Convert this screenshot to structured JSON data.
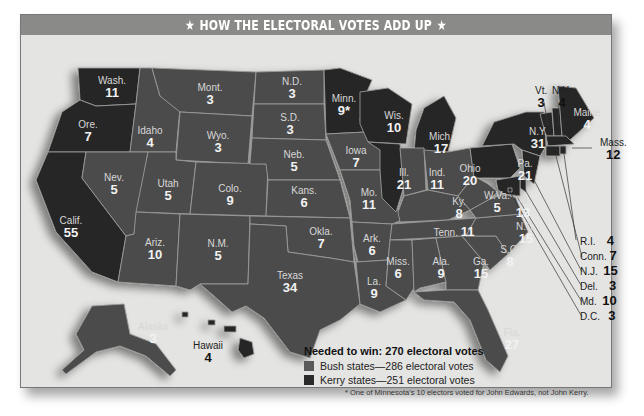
{
  "title": "HOW THE ELECTORAL VOTES ADD UP",
  "title_decoration": "star-icon",
  "legend": {
    "needed": "Needed to win: 270 electoral votes",
    "items": [
      {
        "label": "Bush states—286 electoral votes",
        "color": "#4b4b4b"
      },
      {
        "label": "Kerry states—251 electoral votes",
        "color": "#262626"
      }
    ]
  },
  "footnote": "* One of Minnesota's 10 electors voted for John Edwards, not John Kerry.",
  "colors": {
    "bush": "#4b4b4b",
    "kerry": "#262626",
    "background": "#e4e4e2",
    "title_bar": "#8a8a88"
  },
  "states": {
    "wash": {
      "name": "Wash.",
      "votes": "11",
      "winner": "Kerry"
    },
    "ore": {
      "name": "Ore.",
      "votes": "7",
      "winner": "Kerry"
    },
    "calif": {
      "name": "Calif.",
      "votes": "55",
      "winner": "Kerry"
    },
    "idaho": {
      "name": "Idaho",
      "votes": "4",
      "winner": "Bush"
    },
    "nev": {
      "name": "Nev.",
      "votes": "5",
      "winner": "Bush"
    },
    "mont": {
      "name": "Mont.",
      "votes": "3",
      "winner": "Bush"
    },
    "wyo": {
      "name": "Wyo.",
      "votes": "3",
      "winner": "Bush"
    },
    "utah": {
      "name": "Utah",
      "votes": "5",
      "winner": "Bush"
    },
    "ariz": {
      "name": "Ariz.",
      "votes": "10",
      "winner": "Bush"
    },
    "colo": {
      "name": "Colo.",
      "votes": "9",
      "winner": "Bush"
    },
    "nm": {
      "name": "N.M.",
      "votes": "5",
      "winner": "Bush"
    },
    "nd": {
      "name": "N.D.",
      "votes": "3",
      "winner": "Bush"
    },
    "sd": {
      "name": "S.D.",
      "votes": "3",
      "winner": "Bush"
    },
    "neb": {
      "name": "Neb.",
      "votes": "5",
      "winner": "Bush"
    },
    "kans": {
      "name": "Kans.",
      "votes": "6",
      "winner": "Bush"
    },
    "okla": {
      "name": "Okla.",
      "votes": "7",
      "winner": "Bush"
    },
    "texas": {
      "name": "Texas",
      "votes": "34",
      "winner": "Bush"
    },
    "minn": {
      "name": "Minn.",
      "votes": "9*",
      "winner": "Kerry"
    },
    "iowa": {
      "name": "Iowa",
      "votes": "7",
      "winner": "Bush"
    },
    "mo": {
      "name": "Mo.",
      "votes": "11",
      "winner": "Bush"
    },
    "ark": {
      "name": "Ark.",
      "votes": "6",
      "winner": "Bush"
    },
    "la": {
      "name": "La.",
      "votes": "9",
      "winner": "Bush"
    },
    "wis": {
      "name": "Wis.",
      "votes": "10",
      "winner": "Kerry"
    },
    "ill": {
      "name": "Ill.",
      "votes": "21",
      "winner": "Kerry"
    },
    "mich": {
      "name": "Mich.",
      "votes": "17",
      "winner": "Kerry"
    },
    "ind": {
      "name": "Ind.",
      "votes": "11",
      "winner": "Bush"
    },
    "ohio": {
      "name": "Ohio",
      "votes": "20",
      "winner": "Bush"
    },
    "ky": {
      "name": "Ky.",
      "votes": "8",
      "winner": "Bush"
    },
    "tenn": {
      "name": "Tenn.",
      "votes": "11",
      "winner": "Bush"
    },
    "miss": {
      "name": "Miss.",
      "votes": "6",
      "winner": "Bush"
    },
    "ala": {
      "name": "Ala.",
      "votes": "9",
      "winner": "Bush"
    },
    "ga": {
      "name": "Ga.",
      "votes": "15",
      "winner": "Bush"
    },
    "fla": {
      "name": "Fla.",
      "votes": "27",
      "winner": "Bush"
    },
    "sc": {
      "name": "S.C.",
      "votes": "8",
      "winner": "Bush"
    },
    "nc": {
      "name": "N.C.",
      "votes": "15",
      "winner": "Bush"
    },
    "va": {
      "name": "Va.",
      "votes": "13",
      "winner": "Bush"
    },
    "wva": {
      "name": "W.Va.",
      "votes": "5",
      "winner": "Bush"
    },
    "pa": {
      "name": "Pa.",
      "votes": "21",
      "winner": "Kerry"
    },
    "ny": {
      "name": "N.Y.",
      "votes": "31",
      "winner": "Kerry"
    },
    "vt": {
      "name": "Vt.",
      "votes": "3",
      "winner": "Kerry"
    },
    "nh": {
      "name": "N.H.",
      "votes": "4",
      "winner": "Kerry"
    },
    "maine": {
      "name": "Maine",
      "votes": "4",
      "winner": "Kerry"
    },
    "mass": {
      "name": "Mass.",
      "votes": "12",
      "winner": "Kerry"
    },
    "ri": {
      "name": "R.I.",
      "votes": "4",
      "winner": "Kerry"
    },
    "conn": {
      "name": "Conn.",
      "votes": "7",
      "winner": "Kerry"
    },
    "nj": {
      "name": "N.J.",
      "votes": "15",
      "winner": "Kerry"
    },
    "del": {
      "name": "Del.",
      "votes": "3",
      "winner": "Kerry"
    },
    "md": {
      "name": "Md.",
      "votes": "10",
      "winner": "Kerry"
    },
    "dc": {
      "name": "D.C.",
      "votes": "3",
      "winner": "Kerry"
    },
    "alaska": {
      "name": "Alaska",
      "votes": "3",
      "winner": "Bush"
    },
    "hawaii": {
      "name": "Hawaii",
      "votes": "4",
      "winner": "Kerry"
    }
  }
}
